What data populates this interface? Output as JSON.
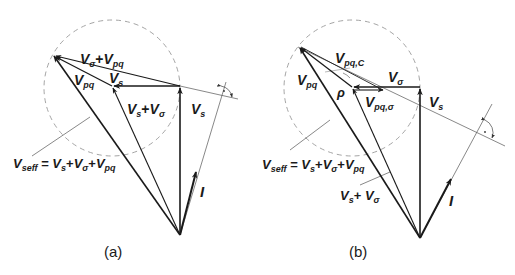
{
  "colors": {
    "ink": "#1a1a1a",
    "thin": "#444444",
    "dashed": "#9a9a9a"
  },
  "diagram_a": {
    "caption": "(a)",
    "labels": {
      "vsigma_plus_vpq": {
        "main1": "V",
        "sub1": "σ",
        "plus": "+",
        "main2": "V",
        "sub2": "pq"
      },
      "vpq": {
        "main": "V",
        "sub": "pq"
      },
      "vs_small": {
        "main": "V",
        "sub": "s"
      },
      "vs_plus_vsigma": {
        "main1": "V",
        "sub1": "s",
        "plus": "+",
        "main2": "V",
        "sub2": "σ"
      },
      "vs": {
        "main": "V",
        "sub": "s"
      },
      "vseff_eq": {
        "lhs_main": "V",
        "lhs_sub": "seff",
        "eq": " = ",
        "t1_main": "V",
        "t1_sub": "s",
        "plus1": "+",
        "t2_main": "V",
        "t2_sub": "σ",
        "plus2": "+",
        "t3_main": "V",
        "t3_sub": "pq"
      },
      "current": "I"
    }
  },
  "diagram_b": {
    "caption": "(b)",
    "labels": {
      "vpq_c": {
        "main": "V",
        "sub": "pq,C"
      },
      "vpq": {
        "main": "V",
        "sub": "pq"
      },
      "rho": "ρ",
      "vsigma": {
        "main": "V",
        "sub": "σ"
      },
      "vpq_sigma": {
        "main": "V",
        "sub": "pq,σ"
      },
      "vs": {
        "main": "V",
        "sub": "s"
      },
      "vseff_eq": {
        "lhs_main": "V",
        "lhs_sub": "seff",
        "eq": " = ",
        "t1_main": "V",
        "t1_sub": "s",
        "plus1": "+",
        "t2_main": "V",
        "t2_sub": "σ",
        "plus2": "+",
        "t3_main": "V",
        "t3_sub": "pq"
      },
      "vs_plus_vsigma": {
        "main1": "V",
        "sub1": "s",
        "plus": "+ ",
        "main2": "V",
        "sub2": "σ"
      },
      "current": "I"
    }
  }
}
